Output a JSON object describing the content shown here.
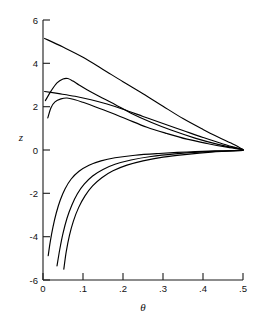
{
  "chart_data": {
    "type": "line",
    "title": "",
    "subtitle": "",
    "xlabel": "θ",
    "ylabel": "z",
    "xlim": [
      0,
      0.5
    ],
    "ylim": [
      -6,
      6
    ],
    "grid": false,
    "legend": null,
    "x_ticks": [
      0,
      0.1,
      0.2,
      0.3,
      0.4,
      0.5
    ],
    "x_tick_labels": [
      "0",
      ".1",
      ".2",
      ".3",
      ".4",
      ".5"
    ],
    "y_ticks": [
      -6,
      -4,
      -2,
      0,
      2,
      4,
      6
    ],
    "y_tick_labels": [
      "-6",
      "-4",
      "-2",
      "0",
      "2",
      "4",
      "6"
    ],
    "series": [
      {
        "name": "branch-1-upper-linear",
        "points": [
          [
            0.004,
            5.15
          ],
          [
            0.05,
            4.75
          ],
          [
            0.1,
            4.28
          ],
          [
            0.15,
            3.72
          ],
          [
            0.2,
            3.15
          ],
          [
            0.25,
            2.6
          ],
          [
            0.3,
            2.02
          ],
          [
            0.35,
            1.45
          ],
          [
            0.4,
            0.95
          ],
          [
            0.44,
            0.58
          ],
          [
            0.47,
            0.32
          ],
          [
            0.5,
            0.02
          ]
        ]
      },
      {
        "name": "branch-2-upper-peak",
        "points": [
          [
            0.012,
            1.48
          ],
          [
            0.02,
            1.95
          ],
          [
            0.03,
            2.22
          ],
          [
            0.045,
            2.36
          ],
          [
            0.06,
            2.4
          ],
          [
            0.08,
            2.32
          ],
          [
            0.1,
            2.2
          ],
          [
            0.13,
            2.0
          ],
          [
            0.17,
            1.72
          ],
          [
            0.21,
            1.42
          ],
          [
            0.26,
            1.05
          ],
          [
            0.31,
            0.76
          ],
          [
            0.36,
            0.5
          ],
          [
            0.41,
            0.3
          ],
          [
            0.46,
            0.13
          ],
          [
            0.5,
            0.02
          ]
        ]
      },
      {
        "name": "branch-3-upper-hump",
        "points": [
          [
            0.006,
            2.28
          ],
          [
            0.02,
            2.72
          ],
          [
            0.035,
            3.1
          ],
          [
            0.05,
            3.28
          ],
          [
            0.062,
            3.3
          ],
          [
            0.075,
            3.18
          ],
          [
            0.09,
            3.0
          ],
          [
            0.11,
            2.78
          ],
          [
            0.14,
            2.48
          ],
          [
            0.18,
            2.1
          ],
          [
            0.22,
            1.7
          ],
          [
            0.27,
            1.28
          ],
          [
            0.32,
            0.92
          ],
          [
            0.38,
            0.55
          ],
          [
            0.44,
            0.25
          ],
          [
            0.5,
            0.02
          ]
        ]
      },
      {
        "name": "branch-4-upper-straight",
        "points": [
          [
            0.004,
            2.7
          ],
          [
            0.04,
            2.6
          ],
          [
            0.08,
            2.48
          ],
          [
            0.12,
            2.32
          ],
          [
            0.16,
            2.12
          ],
          [
            0.2,
            1.88
          ],
          [
            0.25,
            1.55
          ],
          [
            0.3,
            1.22
          ],
          [
            0.35,
            0.9
          ],
          [
            0.4,
            0.58
          ],
          [
            0.45,
            0.28
          ],
          [
            0.5,
            0.02
          ]
        ]
      },
      {
        "name": "branch-5-lower-shallow",
        "points": [
          [
            0.013,
            -4.88
          ],
          [
            0.018,
            -4.25
          ],
          [
            0.025,
            -3.55
          ],
          [
            0.033,
            -2.92
          ],
          [
            0.043,
            -2.32
          ],
          [
            0.055,
            -1.8
          ],
          [
            0.07,
            -1.35
          ],
          [
            0.09,
            -0.98
          ],
          [
            0.115,
            -0.7
          ],
          [
            0.145,
            -0.5
          ],
          [
            0.18,
            -0.36
          ],
          [
            0.23,
            -0.24
          ],
          [
            0.29,
            -0.16
          ],
          [
            0.36,
            -0.09
          ],
          [
            0.43,
            -0.04
          ],
          [
            0.5,
            -0.02
          ]
        ]
      },
      {
        "name": "branch-6-lower-middle",
        "points": [
          [
            0.035,
            -5.35
          ],
          [
            0.042,
            -4.58
          ],
          [
            0.05,
            -3.85
          ],
          [
            0.06,
            -3.15
          ],
          [
            0.072,
            -2.55
          ],
          [
            0.086,
            -2.02
          ],
          [
            0.103,
            -1.58
          ],
          [
            0.124,
            -1.2
          ],
          [
            0.15,
            -0.9
          ],
          [
            0.18,
            -0.66
          ],
          [
            0.22,
            -0.46
          ],
          [
            0.27,
            -0.3
          ],
          [
            0.33,
            -0.18
          ],
          [
            0.39,
            -0.1
          ],
          [
            0.45,
            -0.05
          ],
          [
            0.5,
            -0.02
          ]
        ]
      },
      {
        "name": "branch-7-lower-steep",
        "points": [
          [
            0.052,
            -5.5
          ],
          [
            0.058,
            -4.7
          ],
          [
            0.066,
            -3.95
          ],
          [
            0.076,
            -3.28
          ],
          [
            0.089,
            -2.66
          ],
          [
            0.105,
            -2.12
          ],
          [
            0.124,
            -1.66
          ],
          [
            0.147,
            -1.28
          ],
          [
            0.175,
            -0.96
          ],
          [
            0.21,
            -0.7
          ],
          [
            0.25,
            -0.5
          ],
          [
            0.3,
            -0.33
          ],
          [
            0.36,
            -0.2
          ],
          [
            0.42,
            -0.1
          ],
          [
            0.46,
            -0.06
          ],
          [
            0.5,
            -0.02
          ]
        ]
      }
    ]
  },
  "axis": {
    "x_title": "θ",
    "y_title": "z"
  }
}
